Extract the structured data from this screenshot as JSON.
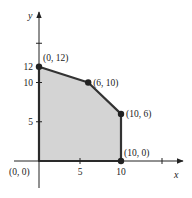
{
  "chart_data": {
    "type": "area",
    "title": "",
    "xlabel": "x",
    "ylabel": "y",
    "xlim": [
      0,
      17
    ],
    "ylim": [
      0,
      19
    ],
    "grid": false,
    "x_ticks": [
      {
        "value": 5,
        "label": "5"
      },
      {
        "value": 10,
        "label": "10"
      },
      {
        "value": 15,
        "label": ""
      }
    ],
    "y_ticks": [
      {
        "value": 5,
        "label": "5"
      },
      {
        "value": 10,
        "label": "10"
      },
      {
        "value": 12,
        "label": "12"
      },
      {
        "value": 15,
        "label": ""
      }
    ],
    "feasible_region": {
      "fill": "#d4d4d4",
      "edge": "#333333",
      "vertices": [
        [
          0,
          0
        ],
        [
          0,
          12
        ],
        [
          6,
          10
        ],
        [
          10,
          6
        ],
        [
          10,
          0
        ]
      ]
    },
    "points": [
      {
        "x": 0,
        "y": 12,
        "label": "(0, 12)"
      },
      {
        "x": 6,
        "y": 10,
        "label": "(6, 10)"
      },
      {
        "x": 10,
        "y": 6,
        "label": "(10, 6)"
      },
      {
        "x": 10,
        "y": 0,
        "label": "(10, 0)"
      }
    ],
    "origin_label": "(0, 0)"
  }
}
